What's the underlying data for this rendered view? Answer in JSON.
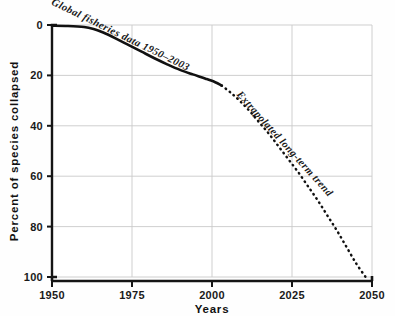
{
  "chart_data": {
    "type": "line",
    "title": "",
    "subtitle": "",
    "xlabel": "Years",
    "ylabel": "Percent of species collapsed",
    "xlim": [
      1950,
      2050
    ],
    "ylim": [
      0,
      100
    ],
    "y_axis_inverted": true,
    "grid": true,
    "legend_position": "inline-annotations",
    "xticks": [
      1950,
      1975,
      2000,
      2025,
      2050
    ],
    "xtick_labels": [
      "1950",
      "1975",
      "2000",
      "2025",
      "2050"
    ],
    "yticks": [
      0,
      20,
      40,
      60,
      80,
      100
    ],
    "ytick_labels": [
      "0",
      "20",
      "40",
      "60",
      "80",
      "100"
    ],
    "series": [
      {
        "name": "Global fisheries data 1950–2003",
        "style": "solid",
        "color": "#111111",
        "x": [
          1950,
          1955,
          1960,
          1963,
          1966,
          1970,
          1974,
          1978,
          1982,
          1986,
          1990,
          1994,
          1998,
          2001,
          2003
        ],
        "values": [
          0.3,
          0.4,
          0.8,
          1.6,
          3.0,
          5.4,
          8.0,
          10.6,
          13.2,
          15.6,
          17.8,
          19.6,
          21.3,
          22.7,
          24.0
        ]
      },
      {
        "name": "Extrapolated long-term trend",
        "style": "dotted",
        "color": "#111111",
        "x": [
          2003,
          2006,
          2009,
          2012,
          2015,
          2018,
          2021,
          2024,
          2027,
          2030,
          2033,
          2036,
          2039,
          2042,
          2045,
          2048
        ],
        "values": [
          24.0,
          27.0,
          30.5,
          34.5,
          39.0,
          43.5,
          48.5,
          53.5,
          58.5,
          64.0,
          69.5,
          75.5,
          81.5,
          88.0,
          94.5,
          100.0
        ]
      }
    ],
    "annotations": [
      {
        "name": "observed-data-label",
        "text": "Global fisheries data 1950–2003",
        "rotation": 26,
        "x": 1971,
        "y": 5
      },
      {
        "name": "extrapolation-label",
        "text": "Extrapolated long-term trend",
        "rotation": 48,
        "x": 2022,
        "y": 48
      }
    ]
  },
  "axes": {
    "x_title": "Years",
    "y_title": "Percent of species collapsed"
  }
}
